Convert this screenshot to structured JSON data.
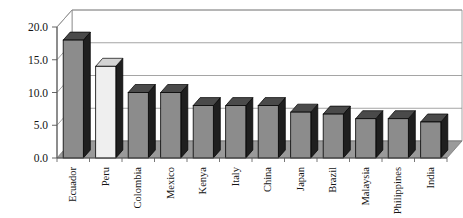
{
  "chart_data": {
    "type": "bar",
    "title": "",
    "subtitle": "",
    "xlabel": "",
    "ylabel": "",
    "categories": [
      "Ecuador",
      "Peru",
      "Colombia",
      "Mexico",
      "Kenya",
      "Italy",
      "China",
      "Japan",
      "Brazil",
      "Malaysia",
      "Philippines",
      "India"
    ],
    "values": [
      18.0,
      14.0,
      10.0,
      10.0,
      8.0,
      8.0,
      8.0,
      7.0,
      6.7,
      6.0,
      6.0,
      5.5
    ],
    "ylim": [
      0.0,
      20.0
    ],
    "ytick_values": [
      0.0,
      5.0,
      10.0,
      15.0,
      20.0
    ],
    "ytick_labels": [
      "0.0",
      "5.0",
      "10.0",
      "15.0",
      "20.0"
    ],
    "grid": true,
    "grid_axis": "y",
    "legend": false,
    "legend_position": "none",
    "style": "3d-column",
    "bar_colors": [
      "#8c8c8c",
      "#efefef",
      "#8c8c8c",
      "#8c8c8c",
      "#8c8c8c",
      "#8c8c8c",
      "#8c8c8c",
      "#8c8c8c",
      "#8c8c8c",
      "#8c8c8c",
      "#8c8c8c",
      "#8c8c8c"
    ],
    "highlight_category": "Peru",
    "annotations": []
  },
  "colors": {
    "bar_front_default": "#8c8c8c",
    "bar_front_highlight": "#efefef",
    "bar_side": "#1f1f1f",
    "bar_top": "#4a4a4a",
    "bar_top_highlight": "#d4d4d4",
    "bar_outline": "#000000",
    "floor": "#9a9a9a",
    "wall": "#ffffff",
    "gridline": "#8e8e8e",
    "axis_line": "#555555",
    "text": "#141414",
    "background": "#ffffff"
  }
}
